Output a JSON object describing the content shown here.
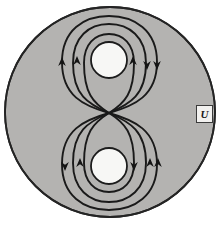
{
  "figure": {
    "region_label": "U",
    "colors": {
      "background": "#ffffff",
      "region_fill": "#b4b3b1",
      "region_stroke": "#242424",
      "hole_fill": "#f7f7f5",
      "hole_stroke": "#1c1c1c",
      "orbit_stroke": "#1a1a1a",
      "label_text": "#181818",
      "label_box_fill": "#f2f1ef",
      "label_box_border": "#3a3a3a"
    },
    "disk": {
      "cx": 110,
      "cy": 112,
      "r": 105
    },
    "holes": [
      {
        "name": "upper-hole",
        "cx": 109,
        "cy": 60,
        "r": 18
      },
      {
        "name": "lower-hole",
        "cx": 109,
        "cy": 166,
        "r": 18
      }
    ],
    "saddle_point": {
      "x": 109,
      "y": 113
    },
    "orbits": [
      {
        "name": "upper-orbit-inner",
        "lobe": "upper",
        "half_width": 25,
        "apex": 34
      },
      {
        "name": "upper-orbit-middle",
        "lobe": "upper",
        "half_width": 36,
        "apex": 24
      },
      {
        "name": "upper-orbit-outer",
        "lobe": "upper",
        "half_width": 47,
        "apex": 16
      },
      {
        "name": "lower-orbit-inner",
        "lobe": "lower",
        "half_width": 25,
        "apex": 192
      },
      {
        "name": "lower-orbit-middle",
        "lobe": "lower",
        "half_width": 36,
        "apex": 202
      },
      {
        "name": "lower-orbit-outer",
        "lobe": "lower",
        "half_width": 47,
        "apex": 210
      }
    ],
    "arrows": [
      {
        "name": "arrow-upper-left-outer",
        "x": 62,
        "y": 64,
        "direction": "up"
      },
      {
        "name": "arrow-upper-left-middle",
        "x": 77,
        "y": 63,
        "direction": "up"
      },
      {
        "name": "arrow-upper-right-inner",
        "x": 133,
        "y": 63,
        "direction": "up"
      },
      {
        "name": "arrow-upper-right-outer",
        "x": 147,
        "y": 64,
        "direction": "down"
      },
      {
        "name": "arrow-upper-right-far",
        "x": 157,
        "y": 64,
        "direction": "down"
      },
      {
        "name": "arrow-lower-left-outer",
        "x": 65,
        "y": 165,
        "direction": "down"
      },
      {
        "name": "arrow-lower-left-middle",
        "x": 80,
        "y": 165,
        "direction": "up"
      },
      {
        "name": "arrow-lower-right-inner",
        "x": 134,
        "y": 165,
        "direction": "down"
      },
      {
        "name": "arrow-lower-right-outer",
        "x": 150,
        "y": 165,
        "direction": "up"
      },
      {
        "name": "arrow-lower-right-far",
        "x": 158,
        "y": 165,
        "direction": "up"
      }
    ],
    "label_position": {
      "x": 196,
      "y": 105,
      "w": 15,
      "h": 16
    }
  }
}
